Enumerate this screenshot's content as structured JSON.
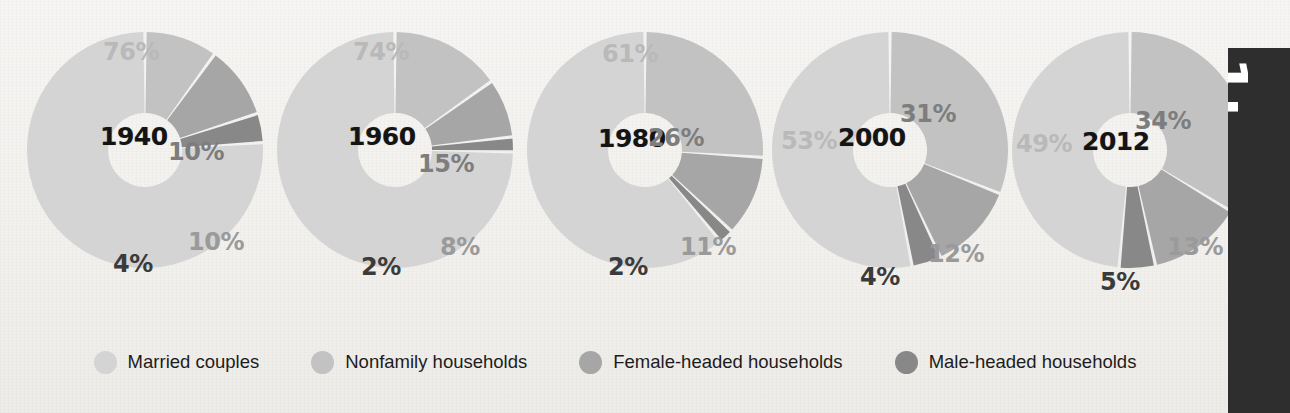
{
  "legend": {
    "items": [
      {
        "label": "Married couples",
        "color": "#d4d4d4",
        "key": "married"
      },
      {
        "label": "Nonfamily households",
        "color": "#c2c2c2",
        "key": "nonfamily"
      },
      {
        "label": "Female-headed households",
        "color": "#a6a6a6",
        "key": "female"
      },
      {
        "label": "Male-headed households",
        "color": "#888888",
        "key": "male"
      }
    ]
  },
  "side_panel": {
    "text": "1:"
  },
  "footnote": {
    "text": ""
  },
  "chart_data": {
    "type": "pie",
    "title": "",
    "legend_position": "bottom",
    "categories": [
      "Married couples",
      "Nonfamily households",
      "Female-headed households",
      "Male-headed households"
    ],
    "colors": [
      "#d4d4d4",
      "#c2c2c2",
      "#a6a6a6",
      "#888888"
    ],
    "charts": [
      {
        "year": "1940",
        "values": [
          76,
          10,
          10,
          4
        ],
        "labels": [
          "76%",
          "10%",
          "10%",
          "4%"
        ]
      },
      {
        "year": "1960",
        "values": [
          74,
          15,
          8,
          2
        ],
        "labels": [
          "74%",
          "15%",
          "8%",
          "2%"
        ]
      },
      {
        "year": "1980",
        "values": [
          61,
          26,
          11,
          2
        ],
        "labels": [
          "61%",
          "26%",
          "11%",
          "2%"
        ]
      },
      {
        "year": "2000",
        "values": [
          53,
          31,
          12,
          4
        ],
        "labels": [
          "53%",
          "31%",
          "12%",
          "4%"
        ]
      },
      {
        "year": "2012",
        "values": [
          49,
          34,
          13,
          5
        ],
        "labels": [
          "49%",
          "34%",
          "13%",
          "5%"
        ]
      }
    ]
  },
  "layout": {
    "chart_x": [
      20,
      270,
      520,
      765,
      1005
    ],
    "year_pos": [
      {
        "x": 100,
        "y": 122
      },
      {
        "x": 348,
        "y": 122
      },
      {
        "x": 598,
        "y": 124
      },
      {
        "x": 838,
        "y": 123
      },
      {
        "x": 1082,
        "y": 127
      }
    ],
    "label_pos": [
      [
        {
          "x": 103,
          "y": 38,
          "cls": "married"
        },
        {
          "x": 168,
          "y": 138,
          "cls": "nonfamily"
        },
        {
          "x": 188,
          "y": 228,
          "cls": "female"
        },
        {
          "x": 113,
          "y": 250,
          "cls": "male"
        }
      ],
      [
        {
          "x": 353,
          "y": 38,
          "cls": "married"
        },
        {
          "x": 418,
          "y": 150,
          "cls": "nonfamily"
        },
        {
          "x": 440,
          "y": 233,
          "cls": "female"
        },
        {
          "x": 361,
          "y": 253,
          "cls": "male"
        }
      ],
      [
        {
          "x": 602,
          "y": 40,
          "cls": "married"
        },
        {
          "x": 648,
          "y": 124,
          "cls": "nonfamily"
        },
        {
          "x": 680,
          "y": 233,
          "cls": "female"
        },
        {
          "x": 608,
          "y": 253,
          "cls": "male"
        }
      ],
      [
        {
          "x": 781,
          "y": 127,
          "cls": "married"
        },
        {
          "x": 900,
          "y": 100,
          "cls": "nonfamily"
        },
        {
          "x": 928,
          "y": 240,
          "cls": "female"
        },
        {
          "x": 860,
          "y": 263,
          "cls": "male"
        }
      ],
      [
        {
          "x": 1016,
          "y": 130,
          "cls": "married"
        },
        {
          "x": 1135,
          "y": 107,
          "cls": "nonfamily"
        },
        {
          "x": 1167,
          "y": 233,
          "cls": "female"
        },
        {
          "x": 1100,
          "y": 268,
          "cls": "male"
        }
      ]
    ]
  }
}
